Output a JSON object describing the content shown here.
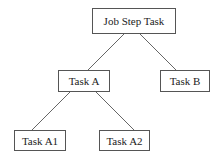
{
  "diagram": {
    "type": "tree",
    "nodes": {
      "root": {
        "label": "Job Step Task",
        "x": 92,
        "y": 8,
        "w": 84,
        "h": 26
      },
      "a": {
        "label": "Task A",
        "x": 58,
        "y": 70,
        "w": 52,
        "h": 22
      },
      "b": {
        "label": "Task B",
        "x": 160,
        "y": 70,
        "w": 50,
        "h": 22
      },
      "a1": {
        "label": "Task A1",
        "x": 14,
        "y": 130,
        "w": 52,
        "h": 21
      },
      "a2": {
        "label": "Task A2",
        "x": 99,
        "y": 130,
        "w": 51,
        "h": 21
      }
    },
    "edges": [
      {
        "from": "root",
        "to": "a",
        "x1": 124,
        "y1": 34,
        "x2": 88,
        "y2": 70
      },
      {
        "from": "root",
        "to": "b",
        "x1": 140,
        "y1": 34,
        "x2": 176,
        "y2": 70
      },
      {
        "from": "a",
        "to": "a1",
        "x1": 70,
        "y1": 92,
        "x2": 32,
        "y2": 130
      },
      {
        "from": "a",
        "to": "a2",
        "x1": 96,
        "y1": 92,
        "x2": 134,
        "y2": 130
      }
    ]
  }
}
